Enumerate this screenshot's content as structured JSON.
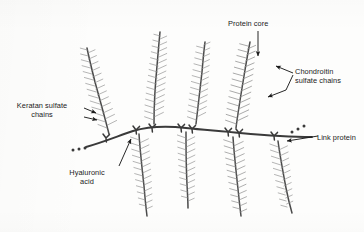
{
  "figure": {
    "background_color": "#fdfdfc",
    "ink_color": "#3a3a3a",
    "bristle_color": "#8d8d8d",
    "text_color": "#1b1b1b"
  },
  "labels": {
    "keratan_sulfate": "Keratan sulfate\nchains",
    "hyaluronic_acid": "Hyaluronic\nacid",
    "protein_core": "Protein core",
    "chondroitin_sulfate": "Chondroitin\nsulfate chains",
    "link_protein": "Link protein"
  },
  "annotations": {
    "keratan_arrows": 2,
    "chondroitin_arrows": 2,
    "protein_core_arrows": 1,
    "link_protein_arrows": 1,
    "hyaluronic_arrows": 1,
    "ellipsis_left_dots": 3,
    "ellipsis_right_dots": 3
  },
  "structure": {
    "backbone_name": "hyaluronic-acid-backbone",
    "branch_count_up": 4,
    "branch_count_down": 4,
    "link_protein_count": 8
  }
}
